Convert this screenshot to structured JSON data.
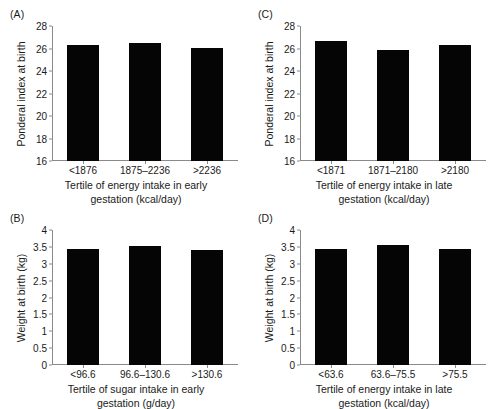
{
  "figure": {
    "panels": [
      {
        "key": "A",
        "letter": "(A)",
        "ylabel": "Ponderal index at birth",
        "xlabel_line1": "Tertile of energy intake in early",
        "xlabel_line2": "gestation (kcal/day)",
        "categories": [
          "<1876",
          "1875–2236",
          ">2236"
        ],
        "values": [
          26.3,
          26.5,
          26.05
        ],
        "yticks": [
          "16",
          "18",
          "20",
          "22",
          "24",
          "26",
          "28"
        ],
        "ymin": 16,
        "ymax": 28
      },
      {
        "key": "C",
        "letter": "(C)",
        "ylabel": "Ponderal index at birth",
        "xlabel_line1": "Tertile of energy intake in late",
        "xlabel_line2": "gestation (kcal/day)",
        "categories": [
          "<1871",
          "1871–2180",
          ">2180"
        ],
        "values": [
          26.7,
          25.85,
          26.35
        ],
        "yticks": [
          "16",
          "18",
          "20",
          "22",
          "24",
          "26",
          "28"
        ],
        "ymin": 16,
        "ymax": 28
      },
      {
        "key": "B",
        "letter": "(B)",
        "ylabel": "Weight at birth (kg)",
        "xlabel_line1": "Tertile of sugar intake in early",
        "xlabel_line2": "gestation (g/day)",
        "categories": [
          "<96.6",
          "96.6–130.6",
          ">130.6"
        ],
        "values": [
          3.43,
          3.52,
          3.41
        ],
        "yticks": [
          "0",
          "0.5",
          "1",
          "1.5",
          "2",
          "2.5",
          "3",
          "3.5",
          "4"
        ],
        "ymin": 0,
        "ymax": 4
      },
      {
        "key": "D",
        "letter": "(D)",
        "ylabel": "Weight at birth (kg)",
        "xlabel_line1": "Tertile of energy intake in late",
        "xlabel_line2": "gestation (kcal/day)",
        "categories": [
          "<63.6",
          "63.6–75.5",
          ">75.5"
        ],
        "values": [
          3.43,
          3.55,
          3.43
        ],
        "yticks": [
          "0",
          "0.5",
          "1",
          "1.5",
          "2",
          "2.5",
          "3",
          "3.5",
          "4"
        ],
        "ymin": 0,
        "ymax": 4
      }
    ]
  },
  "chart_data": [
    {
      "type": "bar",
      "panel": "A",
      "title": "(A)",
      "categories": [
        "<1876",
        "1875–2236",
        ">2236"
      ],
      "values": [
        26.3,
        26.5,
        26.05
      ],
      "xlabel": "Tertile of energy intake in early gestation (kcal/day)",
      "ylabel": "Ponderal index at birth",
      "ylim": [
        16,
        28
      ],
      "ytick_values": [
        16,
        18,
        20,
        22,
        24,
        26,
        28
      ],
      "grid": false,
      "legend": false,
      "bar_color": "#050505"
    },
    {
      "type": "bar",
      "panel": "B",
      "title": "(B)",
      "categories": [
        "<96.6",
        "96.6–130.6",
        ">130.6"
      ],
      "values": [
        3.43,
        3.52,
        3.41
      ],
      "xlabel": "Tertile of sugar intake in early gestation (g/day)",
      "ylabel": "Weight at birth (kg)",
      "ylim": [
        0,
        4
      ],
      "ytick_values": [
        0,
        0.5,
        1,
        1.5,
        2,
        2.5,
        3,
        3.5,
        4
      ],
      "grid": false,
      "legend": false,
      "bar_color": "#050505"
    },
    {
      "type": "bar",
      "panel": "C",
      "title": "(C)",
      "categories": [
        "<1871",
        "1871–2180",
        ">2180"
      ],
      "values": [
        26.7,
        25.85,
        26.35
      ],
      "xlabel": "Tertile of energy intake in late gestation (kcal/day)",
      "ylabel": "Ponderal index at birth",
      "ylim": [
        16,
        28
      ],
      "ytick_values": [
        16,
        18,
        20,
        22,
        24,
        26,
        28
      ],
      "grid": false,
      "legend": false,
      "bar_color": "#050505"
    },
    {
      "type": "bar",
      "panel": "D",
      "title": "(D)",
      "categories": [
        "<63.6",
        "63.6–75.5",
        ">75.5"
      ],
      "values": [
        3.43,
        3.55,
        3.43
      ],
      "xlabel": "Tertile of energy intake in late gestation (kcal/day)",
      "ylabel": "Weight at birth (kg)",
      "ylim": [
        0,
        4
      ],
      "ytick_values": [
        0,
        0.5,
        1,
        1.5,
        2,
        2.5,
        3,
        3.5,
        4
      ],
      "grid": false,
      "legend": false,
      "bar_color": "#050505"
    }
  ]
}
